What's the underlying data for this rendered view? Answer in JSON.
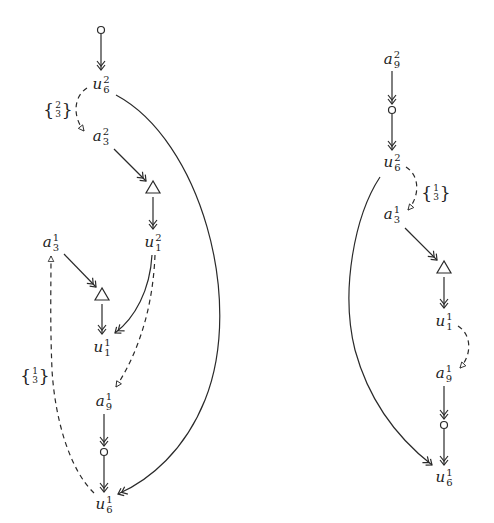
{
  "diagram": {
    "type": "directed-graph",
    "left_graph": {
      "nodes": [
        {
          "id": "L_start",
          "kind": "circle",
          "x": 101,
          "y": 30
        },
        {
          "id": "L_u62",
          "kind": "label",
          "base": "u",
          "sub": "6",
          "sup": "2",
          "x": 101,
          "y": 85
        },
        {
          "id": "L_a32",
          "kind": "label",
          "base": "a",
          "sub": "3",
          "sup": "2",
          "x": 101,
          "y": 137
        },
        {
          "id": "L_tri1",
          "kind": "triangle",
          "x": 153,
          "y": 189
        },
        {
          "id": "L_u12",
          "kind": "label",
          "base": "u",
          "sub": "1",
          "sup": "2",
          "x": 153,
          "y": 243
        },
        {
          "id": "L_a31",
          "kind": "label",
          "base": "a",
          "sub": "3",
          "sup": "1",
          "x": 51,
          "y": 243
        },
        {
          "id": "L_tri2",
          "kind": "triangle",
          "x": 102,
          "y": 296
        },
        {
          "id": "L_u11",
          "kind": "label",
          "base": "u",
          "sub": "1",
          "sup": "1",
          "x": 102,
          "y": 348
        },
        {
          "id": "L_a91",
          "kind": "label",
          "base": "a",
          "sub": "9",
          "sup": "1",
          "x": 104,
          "y": 402
        },
        {
          "id": "L_circ",
          "kind": "circle",
          "x": 104,
          "y": 452
        },
        {
          "id": "L_u61",
          "kind": "label",
          "base": "u",
          "sub": "6",
          "sup": "1",
          "x": 104,
          "y": 505
        }
      ],
      "set_labels": [
        {
          "id": "L_set1",
          "numerator": "2",
          "denominator": "3",
          "x": 58,
          "y": 110
        },
        {
          "id": "L_set2",
          "numerator": "1",
          "denominator": "3",
          "x": 35,
          "y": 376
        }
      ]
    },
    "right_graph": {
      "nodes": [
        {
          "id": "R_a92",
          "kind": "label",
          "base": "a",
          "sub": "9",
          "sup": "2",
          "x": 392,
          "y": 60
        },
        {
          "id": "R_circ1",
          "kind": "circle",
          "x": 392,
          "y": 110
        },
        {
          "id": "R_u62",
          "kind": "label",
          "base": "u",
          "sub": "6",
          "sup": "2",
          "x": 392,
          "y": 163
        },
        {
          "id": "R_a31",
          "kind": "label",
          "base": "a",
          "sub": "3",
          "sup": "1",
          "x": 392,
          "y": 215
        },
        {
          "id": "R_tri",
          "kind": "triangle",
          "x": 444,
          "y": 269
        },
        {
          "id": "R_u11",
          "kind": "label",
          "base": "u",
          "sub": "1",
          "sup": "1",
          "x": 444,
          "y": 322
        },
        {
          "id": "R_a91",
          "kind": "label",
          "base": "a",
          "sub": "9",
          "sup": "1",
          "x": 444,
          "y": 374
        },
        {
          "id": "R_circ2",
          "kind": "circle",
          "x": 444,
          "y": 425
        },
        {
          "id": "R_u61",
          "kind": "label",
          "base": "u",
          "sub": "6",
          "sup": "1",
          "x": 444,
          "y": 478
        }
      ],
      "set_labels": [
        {
          "id": "R_set1",
          "numerator": "1",
          "denominator": "3",
          "x": 436,
          "y": 193
        }
      ]
    },
    "edge_styles": {
      "solid": "double-headed arrow (->>)",
      "dashed": "dashed with open triangle head"
    },
    "colors": {
      "stroke": "#2a2a2a",
      "background": "#ffffff"
    }
  }
}
